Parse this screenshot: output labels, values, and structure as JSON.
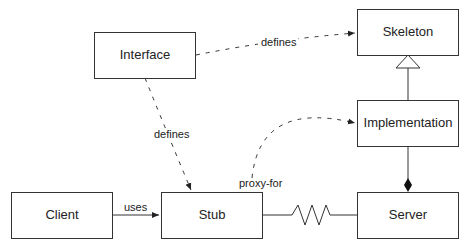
{
  "diagram": {
    "type": "uml-class-diagram",
    "nodes": {
      "interface": {
        "label": "Interface"
      },
      "skeleton": {
        "label": "Skeleton"
      },
      "implementation": {
        "label": "Implementation"
      },
      "client": {
        "label": "Client"
      },
      "stub": {
        "label": "Stub"
      },
      "server": {
        "label": "Server"
      }
    },
    "edges": {
      "interface_skeleton": {
        "from": "Interface",
        "to": "Skeleton",
        "label": "defines",
        "style": "dashed-arrow"
      },
      "interface_stub": {
        "from": "Interface",
        "to": "Stub",
        "label": "defines",
        "style": "dashed-arrow"
      },
      "stub_implementation": {
        "from": "Stub",
        "to": "Implementation",
        "label": "proxy-for",
        "style": "dashed-curved-arrow"
      },
      "client_stub": {
        "from": "Client",
        "to": "Stub",
        "label": "uses",
        "style": "solid-arrow"
      },
      "implementation_skeleton": {
        "from": "Implementation",
        "to": "Skeleton",
        "label": "",
        "style": "generalization"
      },
      "server_implementation": {
        "from": "Server",
        "to": "Implementation",
        "label": "",
        "style": "composition"
      },
      "stub_server": {
        "from": "Stub",
        "to": "Server",
        "label": "",
        "style": "zigzag-connection"
      }
    }
  }
}
